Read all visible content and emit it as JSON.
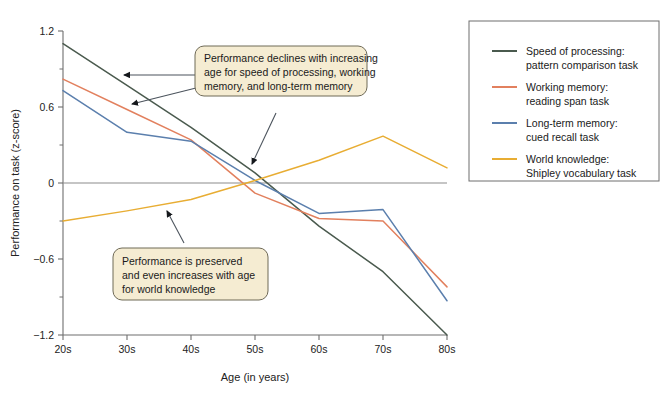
{
  "chart_data": {
    "type": "line",
    "title": "",
    "xlabel": "Age (in years)",
    "ylabel": "Performance on task (z-score)",
    "categories": [
      "20s",
      "30s",
      "40s",
      "50s",
      "60s",
      "70s",
      "80s"
    ],
    "xlim": [
      0,
      6
    ],
    "ylim": [
      -1.2,
      1.2
    ],
    "yticks": [
      "1.2",
      "0.6",
      "0",
      "-0.6",
      "-1.2"
    ],
    "ytick_values": [
      1.2,
      0.6,
      0,
      -0.6,
      -1.2
    ],
    "minor_ticks": true,
    "grid": false,
    "zero_line": true,
    "legend_position": "right",
    "series": [
      {
        "name": "Speed of processing:\npattern comparison task",
        "label_line1": "Speed of processing:",
        "label_line2": "pattern comparison task",
        "color": "#4a5a4e",
        "values": [
          1.1,
          0.77,
          0.44,
          0.08,
          -0.34,
          -0.7,
          -1.2
        ]
      },
      {
        "name": "Working memory:\nreading span task",
        "label_line1": "Working memory:",
        "label_line2": "reading span task",
        "color": "#e2805e",
        "values": [
          0.82,
          0.58,
          0.34,
          -0.08,
          -0.28,
          -0.3,
          -0.82
        ]
      },
      {
        "name": "Long-term memory:\ncued recall task",
        "label_line1": "Long-term memory:",
        "label_line2": "cued recall task",
        "color": "#5b7fad",
        "values": [
          0.73,
          0.4,
          0.33,
          0.02,
          -0.24,
          -0.21,
          -0.93
        ]
      },
      {
        "name": "World knowledge:\nShipley vocabulary task",
        "label_line1": "World knowledge:",
        "label_line2": "Shipley vocabulary task",
        "color": "#e8ad33",
        "values": [
          -0.3,
          -0.22,
          -0.13,
          0.02,
          0.18,
          0.37,
          0.12
        ]
      }
    ],
    "annotations": [
      {
        "id": "decline-callout",
        "lines": [
          "Performance declines with increasing",
          "age for speed of processing, working",
          "memory, and long-term memory"
        ],
        "arrow_targets": [
          "speed-of-processing-line",
          "working-memory-line",
          "long-term-memory-line"
        ]
      },
      {
        "id": "preserved-callout",
        "lines": [
          "Performance is preserved",
          "and even increases with age",
          "for world knowledge"
        ],
        "arrow_targets": [
          "world-knowledge-line"
        ]
      }
    ]
  },
  "style": {
    "callout_fill": "#f5ecd2",
    "callout_border": "#6f6a57",
    "axis_color": "#6e6e6e",
    "zero_line_color": "#8c8c8c",
    "legend_border": "#6e6e6e",
    "arrow_color": "#3a4450",
    "background": "#ffffff"
  }
}
